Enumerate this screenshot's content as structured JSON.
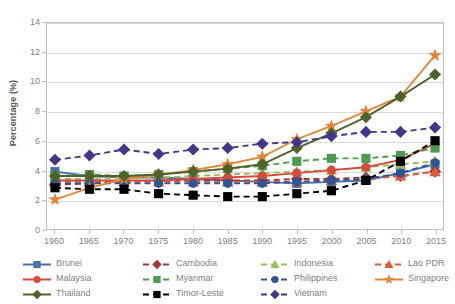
{
  "chart_data": {
    "type": "line",
    "title": "",
    "xlabel": "",
    "ylabel": "Percentage (%)",
    "x": [
      1960,
      1965,
      1970,
      1975,
      1980,
      1985,
      1990,
      1995,
      2000,
      2005,
      2010,
      2015
    ],
    "xtick_labels": [
      "1960",
      "1965",
      "1970",
      "1975",
      "1980",
      "1985",
      "1990",
      "1995",
      "2000",
      "2005",
      "2010",
      "2015"
    ],
    "ytick_labels": [
      "0",
      "2",
      "4",
      "6",
      "8",
      "10",
      "12",
      "14"
    ],
    "ytick_values": [
      0,
      2,
      4,
      6,
      8,
      10,
      12,
      14
    ],
    "xlim": [
      1960,
      2015
    ],
    "ylim": [
      0,
      14
    ],
    "grid": "horizontal",
    "legend_position": "bottom",
    "series": [
      {
        "name": "Brunei",
        "color": "#4472a8",
        "marker": "square",
        "dash": "solid",
        "values": [
          3.9,
          3.6,
          3.5,
          3.5,
          3.4,
          3.3,
          3.2,
          3.1,
          3.2,
          3.3,
          3.8,
          4.4
        ]
      },
      {
        "name": "Cambodia",
        "color": "#9e3a3a",
        "marker": "diamond",
        "dash": "dashed",
        "values": [
          3.0,
          3.1,
          3.2,
          3.3,
          3.3,
          3.3,
          3.3,
          3.4,
          3.4,
          3.5,
          3.6,
          3.9
        ]
      },
      {
        "name": "Indonesia",
        "color": "#9bbb59",
        "marker": "triangle",
        "dash": "dashed",
        "values": [
          3.4,
          3.4,
          3.5,
          3.5,
          3.6,
          3.7,
          3.8,
          3.9,
          4.0,
          4.2,
          4.4,
          4.6
        ]
      },
      {
        "name": "Lao PDR",
        "color": "#e05b3a",
        "marker": "triangle",
        "dash": "dashed",
        "values": [
          3.2,
          3.2,
          3.2,
          3.2,
          3.2,
          3.2,
          3.2,
          3.2,
          3.3,
          3.4,
          3.6,
          3.9
        ]
      },
      {
        "name": "Malaysia",
        "color": "#d44a3c",
        "marker": "circle",
        "dash": "solid",
        "values": [
          3.3,
          3.3,
          3.3,
          3.3,
          3.4,
          3.5,
          3.6,
          3.8,
          4.0,
          4.2,
          4.7,
          5.8
        ]
      },
      {
        "name": "Myanmar",
        "color": "#4e9a4e",
        "marker": "square",
        "dash": "dashed",
        "values": [
          3.6,
          3.7,
          3.6,
          3.7,
          3.9,
          4.1,
          4.3,
          4.6,
          4.8,
          4.8,
          5.0,
          5.5
        ]
      },
      {
        "name": "Philippines",
        "color": "#2f5597",
        "marker": "circle",
        "dash": "dashed",
        "values": [
          3.1,
          3.1,
          3.1,
          3.1,
          3.1,
          3.1,
          3.1,
          3.2,
          3.3,
          3.4,
          3.8,
          4.5
        ]
      },
      {
        "name": "Singapore",
        "color": "#e0853a",
        "marker": "star",
        "dash": "solid",
        "values": [
          2.0,
          2.8,
          3.4,
          3.7,
          4.0,
          4.4,
          4.9,
          6.1,
          7.0,
          8.0,
          9.0,
          11.8
        ]
      },
      {
        "name": "Thailand",
        "color": "#4f6228",
        "marker": "diamond",
        "dash": "solid",
        "values": [
          3.6,
          3.6,
          3.6,
          3.7,
          3.9,
          4.1,
          4.4,
          5.5,
          6.5,
          7.6,
          9.0,
          10.5
        ]
      },
      {
        "name": "Timor-Leste",
        "color": "#000000",
        "marker": "square",
        "dash": "dashed",
        "values": [
          2.8,
          2.7,
          2.7,
          2.4,
          2.3,
          2.2,
          2.2,
          2.4,
          2.6,
          3.3,
          4.6,
          6.0
        ]
      },
      {
        "name": "Vietnam",
        "color": "#46348c",
        "marker": "diamond",
        "dash": "dashed",
        "values": [
          4.7,
          5.0,
          5.4,
          5.1,
          5.4,
          5.5,
          5.8,
          5.9,
          6.3,
          6.6,
          6.6,
          6.9
        ]
      }
    ],
    "legend_rows": [
      [
        "Brunei",
        "Cambodia",
        "Indonesia",
        "Lao PDR"
      ],
      [
        "Malaysia",
        "Myanmar",
        "Philippines",
        "Singapore"
      ],
      [
        "Thailand",
        "Timor-Leste",
        "Vietnam"
      ]
    ]
  }
}
